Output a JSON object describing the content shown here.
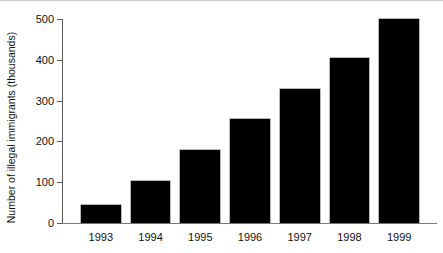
{
  "chart_data": {
    "type": "bar",
    "title": "",
    "xlabel": "",
    "ylabel": "Number of illegal immigrants (thousands)",
    "categories": [
      "1993",
      "1994",
      "1995",
      "1996",
      "1997",
      "1998",
      "1999"
    ],
    "values": [
      45,
      103,
      178,
      255,
      328,
      405,
      500
    ],
    "ylim": [
      0,
      500
    ],
    "yticks": [
      0,
      100,
      200,
      300,
      400,
      500
    ],
    "ytick_labels": [
      "0",
      "100",
      "200",
      "300",
      "400",
      "500"
    ],
    "grid": false,
    "legend": null,
    "bar_color": "#000000",
    "axis_color": "#5a5a5a",
    "background_color": "#ffffff"
  }
}
